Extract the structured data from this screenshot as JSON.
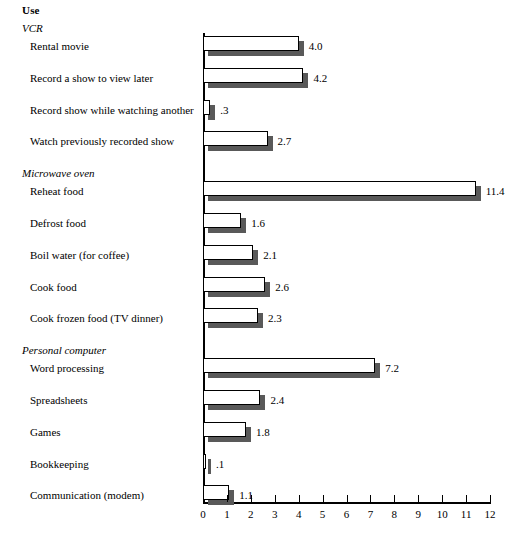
{
  "header": {
    "title": "Use"
  },
  "axis": {
    "ticks": [
      "0",
      "1",
      "2",
      "3",
      "4",
      "5",
      "6",
      "7",
      "8",
      "9",
      "10",
      "11",
      "12"
    ],
    "min": 0,
    "max": 12
  },
  "colors": {
    "bar_face": "#ffffff",
    "bar_shadow": "#595959",
    "axis": "#000000",
    "text": "#000000"
  },
  "chart_data": {
    "type": "bar",
    "orientation": "horizontal",
    "title": "Use",
    "xlabel": "",
    "ylabel": "",
    "xlim": [
      0,
      12
    ],
    "grid": false,
    "legend": null,
    "groups": [
      {
        "name": "VCR",
        "items": [
          {
            "label": "Rental movie",
            "value": 4.0,
            "value_label": "4.0"
          },
          {
            "label": "Record a show to view later",
            "value": 4.2,
            "value_label": "4.2"
          },
          {
            "label": "Record show while watching another",
            "value": 0.3,
            "value_label": ".3"
          },
          {
            "label": "Watch previously recorded show",
            "value": 2.7,
            "value_label": "2.7"
          }
        ]
      },
      {
        "name": "Microwave oven",
        "items": [
          {
            "label": "Reheat food",
            "value": 11.4,
            "value_label": "11.4"
          },
          {
            "label": "Defrost food",
            "value": 1.6,
            "value_label": "1.6"
          },
          {
            "label": "Boil water (for coffee)",
            "value": 2.1,
            "value_label": "2.1"
          },
          {
            "label": "Cook food",
            "value": 2.6,
            "value_label": "2.6"
          },
          {
            "label": "Cook frozen food (TV dinner)",
            "value": 2.3,
            "value_label": "2.3"
          }
        ]
      },
      {
        "name": "Personal computer",
        "items": [
          {
            "label": "Word processing",
            "value": 7.2,
            "value_label": "7.2"
          },
          {
            "label": "Spreadsheets",
            "value": 2.4,
            "value_label": "2.4"
          },
          {
            "label": "Games",
            "value": 1.8,
            "value_label": "1.8"
          },
          {
            "label": "Bookkeeping",
            "value": 0.1,
            "value_label": ".1"
          },
          {
            "label": "Communication (modem)",
            "value": 1.1,
            "value_label": "1.1"
          }
        ]
      }
    ],
    "categories": [
      "Rental movie",
      "Record a show to view later",
      "Record show while watching another",
      "Watch previously recorded show",
      "Reheat food",
      "Defrost food",
      "Boil water (for coffee)",
      "Cook food",
      "Cook frozen food (TV dinner)",
      "Word processing",
      "Spreadsheets",
      "Games",
      "Bookkeeping",
      "Communication (modem)"
    ],
    "values": [
      4.0,
      4.2,
      0.3,
      2.7,
      11.4,
      1.6,
      2.1,
      2.6,
      2.3,
      7.2,
      2.4,
      1.8,
      0.1,
      1.1
    ]
  }
}
